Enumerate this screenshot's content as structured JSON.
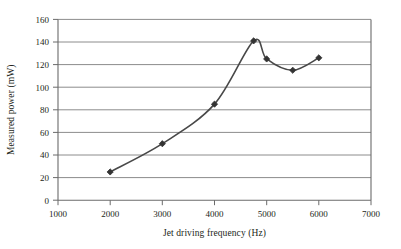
{
  "chart_data": {
    "type": "line",
    "title": "",
    "xlabel": "Jet driving frequency (Hz)",
    "ylabel": "Measured power (mW)",
    "x": [
      2000,
      3000,
      4000,
      4750,
      5000,
      5500,
      6000
    ],
    "values": [
      25,
      50,
      85,
      141,
      125,
      115,
      126
    ],
    "series": [
      {
        "name": "Measured power",
        "x": [
          2000,
          3000,
          4000,
          4750,
          5000,
          5500,
          6000
        ],
        "values": [
          25,
          50,
          85,
          141,
          125,
          115,
          126
        ]
      }
    ],
    "xlim": [
      1000,
      7000
    ],
    "ylim": [
      0,
      160
    ],
    "xticks": [
      1000,
      2000,
      3000,
      4000,
      5000,
      6000,
      7000
    ],
    "yticks": [
      0,
      20,
      40,
      60,
      80,
      100,
      120,
      140,
      160
    ],
    "xtick_labels": [
      "1000",
      "2000",
      "3000",
      "4000",
      "5000",
      "6000",
      "7000"
    ],
    "ytick_labels": [
      "0",
      "20",
      "40",
      "60",
      "80",
      "100",
      "120",
      "140",
      "160"
    ],
    "grid": "horizontal",
    "legend": "none",
    "marker": "diamond",
    "line_color": "#484848",
    "marker_color": "#333333",
    "grid_color": "#8c8c8c",
    "axis_color": "#6b6b6b",
    "background_color": "#ffffff",
    "smoothed": true
  }
}
